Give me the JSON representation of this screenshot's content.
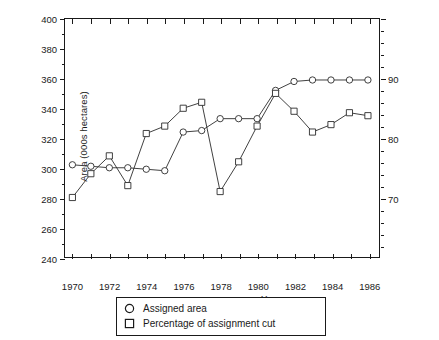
{
  "chart_data": {
    "type": "line",
    "title": "",
    "xlabel": "Year",
    "ylabel": "Area (000s hectares)",
    "ylabel_right": "[Percentage]",
    "x": [
      1970,
      1971,
      1972,
      1973,
      1974,
      1975,
      1976,
      1977,
      1978,
      1979,
      1980,
      1981,
      1982,
      1983,
      1984,
      1985,
      1986
    ],
    "xlim": [
      1969.6,
      1986.6
    ],
    "ylim": [
      240,
      400
    ],
    "yticks": [
      240,
      260,
      280,
      300,
      320,
      340,
      360,
      380,
      400
    ],
    "ylim_right": [
      60,
      100
    ],
    "yticks_right": [
      70,
      80,
      90
    ],
    "xticks": [
      1970,
      1971,
      1972,
      1973,
      1974,
      1975,
      1976,
      1977,
      1978,
      1979,
      1980,
      1981,
      1982,
      1983,
      1984,
      1985,
      1986
    ],
    "xtick_labels": [
      "1970",
      "",
      "1972",
      "",
      "1974",
      "",
      "1976",
      "",
      "1978",
      "",
      "1980",
      "",
      "1982",
      "",
      "1984",
      "",
      "1986"
    ],
    "grid": false,
    "legend_position": "below-center",
    "series": [
      {
        "name": "Assigned area",
        "marker": "circle",
        "unit": "000s hectares",
        "values": [
          302,
          301,
          300,
          300,
          299,
          298,
          324,
          325,
          333,
          333,
          333,
          352,
          358,
          359,
          359,
          359,
          359
        ]
      },
      {
        "name": "Percentage of assignment cut",
        "marker": "square",
        "unit": "000s hectares",
        "values": [
          280,
          296,
          308,
          288,
          323,
          328,
          340,
          344,
          284,
          304,
          328,
          350,
          338,
          324,
          329,
          337,
          335
        ]
      }
    ],
    "series_right_axis_percent": [
      {
        "name": "Assigned area",
        "values": [
          75.5,
          75.2,
          75.0,
          75.0,
          74.8,
          74.5,
          81.0,
          81.2,
          83.2,
          83.2,
          83.2,
          88.0,
          89.5,
          89.8,
          89.8,
          89.8,
          89.8
        ]
      },
      {
        "name": "Percentage of assignment cut",
        "values": [
          70.0,
          74.0,
          77.0,
          72.0,
          80.8,
          82.0,
          85.0,
          86.0,
          71.0,
          76.0,
          82.0,
          87.5,
          84.5,
          81.0,
          82.2,
          84.2,
          83.8
        ]
      }
    ]
  },
  "legend": {
    "items": [
      {
        "label": "Assigned area",
        "marker": "circle-marker-icon"
      },
      {
        "label": "Percentage of assignment cut",
        "marker": "square-marker-icon"
      }
    ]
  },
  "colors": {
    "line": "#2b2b2b",
    "axis": "#1a1a1a",
    "background": "#ffffff"
  }
}
